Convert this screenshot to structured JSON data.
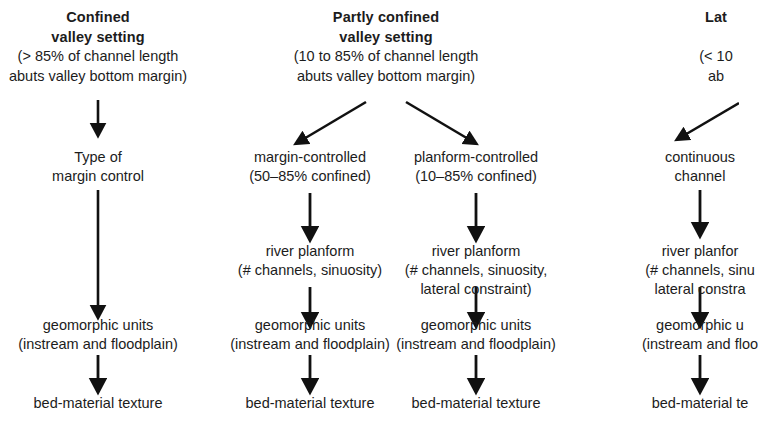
{
  "diagram": {
    "background_color": "#ffffff",
    "text_color": "#1c1c1c",
    "arrow_color": "#111111",
    "columns": [
      {
        "id": "confined",
        "center_x": 98,
        "header": {
          "lines_bold": [
            "Confined",
            "valley setting"
          ],
          "lines_plain": [
            "(> 85% of channel length",
            "abuts valley bottom margin)"
          ]
        },
        "nodes": [
          {
            "id": "type-of-margin-control",
            "lines": [
              "Type of",
              "margin control"
            ]
          },
          {
            "id": "geomorphic-units",
            "lines": [
              "geomorphic units",
              "(instream and floodplain)"
            ]
          },
          {
            "id": "bed-material-texture",
            "lines": [
              "bed-material texture"
            ]
          }
        ]
      },
      {
        "id": "partly-confined-margin",
        "center_x": 310,
        "header": {
          "lines_bold": [
            "Partly confined",
            "valley setting"
          ],
          "lines_plain": [
            "(10 to 85% of channel length",
            "abuts valley bottom margin)"
          ]
        },
        "nodes": [
          {
            "id": "margin-controlled",
            "lines": [
              "margin-controlled",
              "(50–85% confined)"
            ]
          },
          {
            "id": "river-planform",
            "lines": [
              "river planform",
              "(# channels, sinuosity)"
            ]
          },
          {
            "id": "geomorphic-units",
            "lines": [
              "geomorphic units",
              "(instream and floodplain)"
            ]
          },
          {
            "id": "bed-material-texture",
            "lines": [
              "bed-material texture"
            ]
          }
        ]
      },
      {
        "id": "partly-confined-planform",
        "center_x": 476,
        "header": {
          "lines_bold": [],
          "lines_plain": []
        },
        "nodes": [
          {
            "id": "planform-controlled",
            "lines": [
              "planform-controlled",
              "(10–85% confined)"
            ]
          },
          {
            "id": "river-planform",
            "lines": [
              "river planform",
              "(# channels, sinuosity,",
              "lateral constraint)"
            ]
          },
          {
            "id": "geomorphic-units",
            "lines": [
              "geomorphic units",
              "(instream and floodplain)"
            ]
          },
          {
            "id": "bed-material-texture",
            "lines": [
              "bed-material texture"
            ]
          }
        ]
      },
      {
        "id": "laterally-unconfined",
        "center_x": 700,
        "header": {
          "lines_bold": [
            "Lat"
          ],
          "lines_plain": [
            "(< 10",
            "ab"
          ]
        },
        "nodes": [
          {
            "id": "continuous-channel",
            "lines": [
              "continuous",
              "channel"
            ]
          },
          {
            "id": "river-planform",
            "lines": [
              "river planfor",
              "(# channels, sinu",
              "lateral constra"
            ]
          },
          {
            "id": "geomorphic-units",
            "lines": [
              "geomorphic u",
              "(instream and floo"
            ]
          },
          {
            "id": "bed-material-texture",
            "lines": [
              "bed-material te"
            ]
          }
        ]
      }
    ],
    "notes": {
      "truncation": "right column clipped by image edge"
    }
  }
}
